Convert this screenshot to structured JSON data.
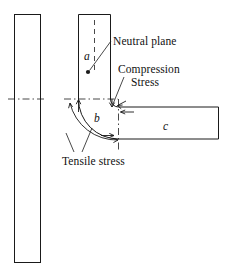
{
  "figure": {
    "background_color": "#ffffff",
    "line_color": "#1a1a1a",
    "text_color": "#111111",
    "width": 236,
    "height": 280,
    "annotations": {
      "neutral_plane": "Neutral plane",
      "compression_stress_line1": "Compression",
      "compression_stress_line2": "Stress",
      "tensile_stress": "Tensile stress"
    },
    "segments": {
      "vertical_arm": "a",
      "bend_region": "b",
      "horizontal_arm": "c"
    },
    "reference_bar": {
      "name": "straight-reference-bar"
    }
  }
}
